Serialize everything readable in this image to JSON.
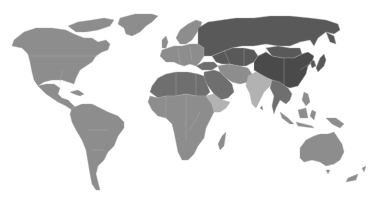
{
  "map": {
    "type": "choropleth-world-map",
    "background": "#ffffff",
    "legend": null,
    "title": null,
    "shades": {
      "darkest": "#4a4a4a",
      "dark": "#595959",
      "mid_dark": "#6f6f6f",
      "medium": "#8d8d8d",
      "light": "#b2b2b2",
      "island_light": "#9a9a9a"
    },
    "regions": [
      {
        "id": "north-america",
        "shade": "medium"
      },
      {
        "id": "greenland",
        "shade": "medium"
      },
      {
        "id": "central-america",
        "shade": "medium"
      },
      {
        "id": "south-america",
        "shade": "medium"
      },
      {
        "id": "europe",
        "shade": "medium"
      },
      {
        "id": "scandinavia",
        "shade": "medium"
      },
      {
        "id": "uk",
        "shade": "medium"
      },
      {
        "id": "russia",
        "shade": "dark"
      },
      {
        "id": "central-asia",
        "shade": "dark"
      },
      {
        "id": "mongolia",
        "shade": "dark"
      },
      {
        "id": "china",
        "shade": "darkest"
      },
      {
        "id": "korea-japan",
        "shade": "dark"
      },
      {
        "id": "middle-east",
        "shade": "mid_dark"
      },
      {
        "id": "iran-afghanistan",
        "shade": "medium"
      },
      {
        "id": "north-africa",
        "shade": "mid_dark"
      },
      {
        "id": "sahel",
        "shade": "mid_dark"
      },
      {
        "id": "sub-saharan-africa",
        "shade": "medium"
      },
      {
        "id": "horn-of-africa",
        "shade": "light"
      },
      {
        "id": "madagascar",
        "shade": "medium"
      },
      {
        "id": "india",
        "shade": "light"
      },
      {
        "id": "southeast-asia",
        "shade": "mid_dark"
      },
      {
        "id": "indonesia",
        "shade": "medium"
      },
      {
        "id": "philippines",
        "shade": "medium"
      },
      {
        "id": "new-guinea",
        "shade": "medium"
      },
      {
        "id": "australia",
        "shade": "medium"
      },
      {
        "id": "new-zealand",
        "shade": "medium"
      }
    ]
  }
}
